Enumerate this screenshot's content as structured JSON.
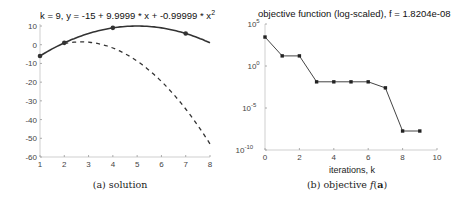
{
  "chart_data": [
    {
      "type": "line",
      "title": "k = 9, y = -15 + 9.9999 * x + -0.99999 * x",
      "title_superscript": "2",
      "xlabel": "",
      "ylabel": "",
      "caption": "(a) solution",
      "xlim": [
        1,
        8
      ],
      "ylim": [
        -60,
        10
      ],
      "xticks": [
        1,
        2,
        3,
        4,
        5,
        6,
        7,
        8
      ],
      "yticks": [
        10,
        0,
        -10,
        -20,
        -30,
        -40,
        -50,
        -60
      ],
      "grid": false,
      "series": [
        {
          "name": "fitted solution (solid)",
          "style": "solid",
          "equation": "y = -15 + 9.9999*x - 0.99999*x^2",
          "coefficients": [
            -15,
            9.9999,
            -0.99999
          ],
          "x_range": [
            1,
            8
          ]
        },
        {
          "name": "data points",
          "style": "markers",
          "x": [
            1,
            2,
            4,
            7
          ],
          "y": [
            -6,
            1,
            9,
            6
          ]
        },
        {
          "name": "previous estimate (dashed)",
          "style": "dashed",
          "x": [
            2,
            2.5,
            3,
            3.5,
            4,
            4.5,
            5,
            5.5,
            6,
            6.5,
            7,
            7.5,
            8
          ],
          "y": [
            0.5,
            1.4,
            1.3,
            0.7,
            -0.3,
            -1.8,
            -3.7,
            -6.1,
            -9.0,
            -12.4,
            -16.2,
            -20.5,
            -25.3
          ]
        }
      ]
    },
    {
      "type": "line",
      "title": "objective function (log-scaled), f = 1.8204e-08",
      "xlabel": "iterations, k",
      "ylabel": "",
      "caption_prefix": "(b) objective ",
      "caption_math": "f(a)",
      "yscale": "log",
      "xlim": [
        0,
        10
      ],
      "ylim": [
        1e-10,
        100000.0
      ],
      "xticks": [
        0,
        2,
        4,
        6,
        8,
        10
      ],
      "yticks": [
        "10^5",
        "10^0",
        "10^-5",
        "10^-10"
      ],
      "ytick_base": [
        "10",
        "10",
        "10",
        "10"
      ],
      "ytick_exp": [
        "5",
        "0",
        "-5",
        "-10"
      ],
      "grid": false,
      "series": [
        {
          "name": "objective",
          "style": "solid-with-markers",
          "x": [
            0,
            1,
            2,
            3,
            4,
            5,
            6,
            7,
            8,
            9
          ],
          "y": [
            2800,
            16,
            16,
            0.013,
            0.013,
            0.013,
            0.013,
            0.0025,
            1.8204e-08,
            1.8204e-08
          ]
        }
      ]
    }
  ]
}
